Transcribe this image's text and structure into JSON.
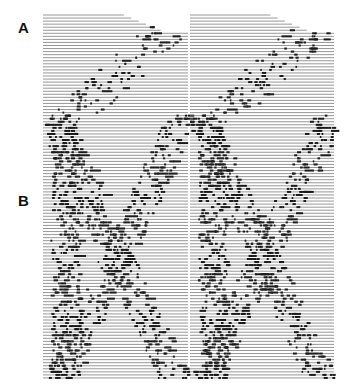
{
  "figure": {
    "panel_labels": [
      {
        "id": "A",
        "text": "A"
      },
      {
        "id": "B",
        "text": "B"
      }
    ],
    "colors": {
      "trace": "#6a6a6a",
      "spike": "#1a1a1a",
      "background": "#ffffff"
    },
    "layout": {
      "top": 15,
      "bottom": 381,
      "row_spacing": 3.05,
      "columns": [
        {
          "x0": 43,
          "x1": 190
        },
        {
          "x0": 190,
          "x1": 336
        }
      ],
      "panel_a_rows": 33
    }
  }
}
